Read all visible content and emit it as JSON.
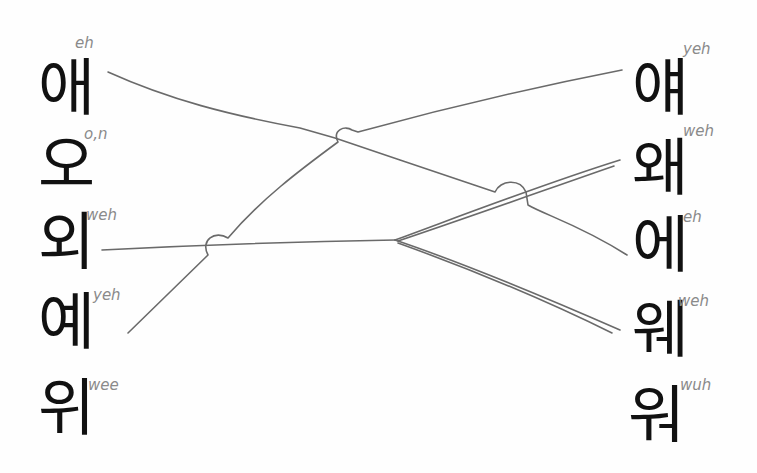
{
  "left_column": [
    {
      "glyph": "애",
      "romanization": "eh"
    },
    {
      "glyph": "오",
      "romanization": "o,n"
    },
    {
      "glyph": "외",
      "romanization": "weh"
    },
    {
      "glyph": "예",
      "romanization": "yeh"
    },
    {
      "glyph": "위",
      "romanization": "wee"
    }
  ],
  "right_column": [
    {
      "glyph": "얘",
      "romanization": "yeh"
    },
    {
      "glyph": "왜",
      "romanization": "weh"
    },
    {
      "glyph": "에",
      "romanization": "eh"
    },
    {
      "glyph": "웨",
      "romanization": "weh"
    },
    {
      "glyph": "워",
      "romanization": "wuh"
    }
  ],
  "connections": [
    {
      "from": "애",
      "to": "에"
    },
    {
      "from": "예",
      "to": "얘"
    },
    {
      "from": "외",
      "to": "왜"
    },
    {
      "from": "외",
      "to": "웨"
    }
  ],
  "colors": {
    "line": "#6a6a6a",
    "glyph": "#111111",
    "annotation": "#8a8a8a",
    "background": "#fefefe"
  }
}
